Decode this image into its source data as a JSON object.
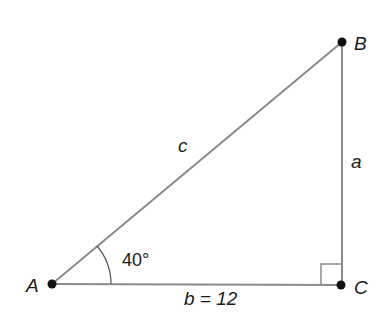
{
  "diagram": {
    "type": "right-triangle",
    "vertices": {
      "A": {
        "label": "A"
      },
      "B": {
        "label": "B"
      },
      "C": {
        "label": "C"
      }
    },
    "sides": {
      "a": {
        "label": "a"
      },
      "b": {
        "label": "b = 12"
      },
      "c": {
        "label": "c"
      }
    },
    "angle_A": {
      "label": "40°"
    },
    "right_angle_at": "C",
    "colors": {
      "line": "#8a8a8a",
      "point": "#111111",
      "text": "#1a1a1a"
    }
  }
}
